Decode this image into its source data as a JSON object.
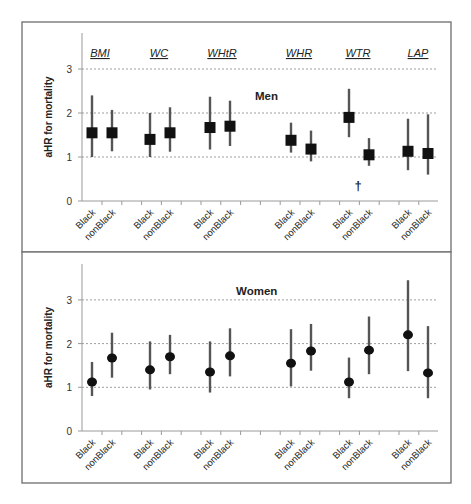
{
  "chart_data": {
    "type": "scatter",
    "subtype": "forest-plot-point-with-error-bars",
    "ylabel": "aHR for mortality",
    "ylim": [
      0,
      3.8
    ],
    "yticks": [
      0,
      1,
      2,
      3
    ],
    "grid": "horizontal dashed at 1, 2, 3",
    "groups": [
      "BMI",
      "WC",
      "WHtR",
      "WHR",
      "WTR",
      "LAP"
    ],
    "categories": [
      "Black",
      "nonBlack"
    ],
    "panels": [
      {
        "title": "Men",
        "marker": "square",
        "series": [
          {
            "group": "BMI",
            "category": "Black",
            "value": 1.55,
            "ci_low": 1.0,
            "ci_high": 2.4
          },
          {
            "group": "BMI",
            "category": "nonBlack",
            "value": 1.55,
            "ci_low": 1.13,
            "ci_high": 2.07
          },
          {
            "group": "WC",
            "category": "Black",
            "value": 1.4,
            "ci_low": 1.0,
            "ci_high": 2.0
          },
          {
            "group": "WC",
            "category": "nonBlack",
            "value": 1.55,
            "ci_low": 1.12,
            "ci_high": 2.13
          },
          {
            "group": "WHtR",
            "category": "Black",
            "value": 1.67,
            "ci_low": 1.17,
            "ci_high": 2.37
          },
          {
            "group": "WHtR",
            "category": "nonBlack",
            "value": 1.7,
            "ci_low": 1.25,
            "ci_high": 2.28
          },
          {
            "group": "WHR",
            "category": "Black",
            "value": 1.38,
            "ci_low": 1.1,
            "ci_high": 1.78
          },
          {
            "group": "WHR",
            "category": "nonBlack",
            "value": 1.18,
            "ci_low": 0.9,
            "ci_high": 1.6
          },
          {
            "group": "WTR",
            "category": "Black",
            "value": 1.9,
            "ci_low": 1.45,
            "ci_high": 2.55
          },
          {
            "group": "WTR",
            "category": "nonBlack",
            "value": 1.05,
            "ci_low": 0.8,
            "ci_high": 1.43
          },
          {
            "group": "LAP",
            "category": "Black",
            "value": 1.13,
            "ci_low": 0.7,
            "ci_high": 1.87
          },
          {
            "group": "LAP",
            "category": "nonBlack",
            "value": 1.08,
            "ci_low": 0.6,
            "ci_high": 1.97
          }
        ],
        "annotations": [
          {
            "text": "†",
            "group": "WTR",
            "position": "between Black and nonBlack, below at ~0.35"
          }
        ]
      },
      {
        "title": "Women",
        "marker": "circle",
        "series": [
          {
            "group": "BMI",
            "category": "Black",
            "value": 1.12,
            "ci_low": 0.8,
            "ci_high": 1.58
          },
          {
            "group": "BMI",
            "category": "nonBlack",
            "value": 1.67,
            "ci_low": 1.22,
            "ci_high": 2.25
          },
          {
            "group": "WC",
            "category": "Black",
            "value": 1.4,
            "ci_low": 0.95,
            "ci_high": 2.05
          },
          {
            "group": "WC",
            "category": "nonBlack",
            "value": 1.7,
            "ci_low": 1.3,
            "ci_high": 2.2
          },
          {
            "group": "WHtR",
            "category": "Black",
            "value": 1.35,
            "ci_low": 0.88,
            "ci_high": 2.05
          },
          {
            "group": "WHtR",
            "category": "nonBlack",
            "value": 1.72,
            "ci_low": 1.25,
            "ci_high": 2.35
          },
          {
            "group": "WHR",
            "category": "Black",
            "value": 1.55,
            "ci_low": 1.02,
            "ci_high": 2.33
          },
          {
            "group": "WHR",
            "category": "nonBlack",
            "value": 1.83,
            "ci_low": 1.38,
            "ci_high": 2.45
          },
          {
            "group": "WTR",
            "category": "Black",
            "value": 1.12,
            "ci_low": 0.75,
            "ci_high": 1.68
          },
          {
            "group": "WTR",
            "category": "nonBlack",
            "value": 1.85,
            "ci_low": 1.3,
            "ci_high": 2.62
          },
          {
            "group": "LAP",
            "category": "Black",
            "value": 2.2,
            "ci_low": 1.37,
            "ci_high": 3.45
          },
          {
            "group": "LAP",
            "category": "nonBlack",
            "value": 1.33,
            "ci_low": 0.75,
            "ci_high": 2.4
          }
        ]
      }
    ]
  },
  "layout": {
    "x_positions": {
      "BMI": [
        92,
        112
      ],
      "WC": [
        150,
        170
      ],
      "WHtR": [
        210,
        230
      ],
      "WHR": [
        291,
        311
      ],
      "WTR": [
        349,
        369
      ],
      "LAP": [
        408,
        428
      ]
    },
    "group_label_x": [
      100,
      159,
      222,
      299,
      358,
      418
    ],
    "panels": [
      {
        "box": [
          22,
          22,
          429,
          230
        ],
        "y0": 201,
        "unit": 44,
        "axis_top": 33,
        "group_label_y": 57,
        "title_x": 255,
        "title_y": 100
      },
      {
        "box": [
          22,
          252,
          429,
          231
        ],
        "y0": 431,
        "unit": 43.7,
        "axis_top": 264,
        "group_label_y": null,
        "title_x": 236,
        "title_y": 295
      }
    ],
    "axis_x": 82,
    "axis_right": 438,
    "dagger_pos": [
      358,
      190
    ]
  }
}
